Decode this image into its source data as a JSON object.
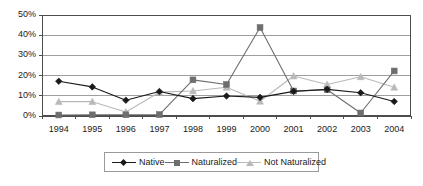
{
  "chart_data": {
    "type": "line",
    "title": "",
    "subtitle": "",
    "xlabel": "",
    "ylabel": "",
    "categories": [
      "1994",
      "1995",
      "1996",
      "1997",
      "1998",
      "1999",
      "2000",
      "2001",
      "2002",
      "2003",
      "2004"
    ],
    "series": [
      {
        "name": "Native",
        "marker": "diamond",
        "color": "#1a1a1a",
        "values": [
          17.2,
          14.4,
          7.8,
          12.1,
          8.6,
          9.9,
          9.2,
          12.2,
          13.2,
          11.5,
          7.2
        ]
      },
      {
        "name": "Naturalized",
        "marker": "square",
        "color": "#6e6e6e",
        "values": [
          0.5,
          0.6,
          0.6,
          0.7,
          17.9,
          15.6,
          43.8,
          12.4,
          13.0,
          1.5,
          22.3
        ]
      },
      {
        "name": "Not Naturalized",
        "marker": "triangle",
        "color": "#b9b9b9",
        "values": [
          7.1,
          7.1,
          2.0,
          11.8,
          12.4,
          14.2,
          7.3,
          19.8,
          15.6,
          19.4,
          14.2
        ]
      }
    ],
    "ylim": [
      0,
      50
    ],
    "ytick_values": [
      0,
      10,
      20,
      30,
      40,
      50
    ],
    "ytick_labels": [
      "0%",
      "10%",
      "20%",
      "30%",
      "40%",
      "50%"
    ],
    "grid": true,
    "grid_axis": "y",
    "legend_position": "bottom",
    "legend_entries": [
      "Native",
      "Naturalized",
      "Not Naturalized"
    ]
  },
  "style": {
    "plot_border_color": "#4d4d4d",
    "gridline_color": "#9e9e9e",
    "background": "#ffffff",
    "text_color": "#1a1a1a"
  }
}
